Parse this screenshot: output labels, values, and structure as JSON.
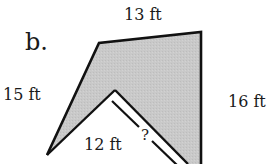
{
  "figure": {
    "part_label": "b.",
    "edges": {
      "top": "13 ft",
      "left": "15 ft",
      "right": "16 ft",
      "inner": "12 ft",
      "unknown": "?"
    },
    "colors": {
      "fill": "#c8c8c8",
      "stroke": "#111111",
      "background": "#ffffff"
    }
  }
}
